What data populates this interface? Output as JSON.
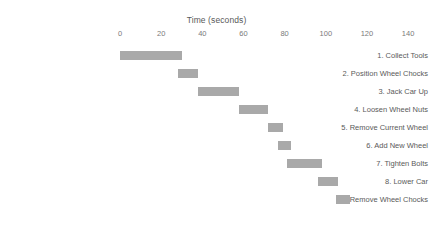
{
  "chart_data": {
    "type": "bar",
    "orientation": "horizontal",
    "subtype": "gantt",
    "title": "",
    "xlabel": "Time (seconds)",
    "ylabel": "",
    "xlim": [
      0,
      150
    ],
    "xticks": [
      0,
      20,
      40,
      60,
      80,
      100,
      120,
      140
    ],
    "xticklabels": [
      "0",
      "20",
      "40",
      "60",
      "80",
      "100",
      "120",
      "140"
    ],
    "grid": false,
    "legend": false,
    "bar_color": "#a9a9a9",
    "background_color": "#ffffff",
    "categories": [
      "1. Collect Tools",
      "2. Position Wheel Chocks",
      "3. Jack Car Up",
      "4. Loosen Wheel Nuts",
      "5. Remove Current Wheel",
      "6. Add New Wheel",
      "7. Tighten Bolts",
      "8. Lower Car",
      "9. Remove Wheel Chocks"
    ],
    "tasks": [
      {
        "label": "1. Collect Tools",
        "start": 0,
        "end": 30,
        "duration": 30
      },
      {
        "label": "2. Position Wheel Chocks",
        "start": 28,
        "end": 38,
        "duration": 10
      },
      {
        "label": "3. Jack Car Up",
        "start": 38,
        "end": 58,
        "duration": 20
      },
      {
        "label": "4. Loosen Wheel Nuts",
        "start": 58,
        "end": 72,
        "duration": 14
      },
      {
        "label": "5. Remove Current Wheel",
        "start": 72,
        "end": 79,
        "duration": 7
      },
      {
        "label": "6. Add New Wheel",
        "start": 77,
        "end": 83,
        "duration": 6
      },
      {
        "label": "7. Tighten Bolts",
        "start": 81,
        "end": 98,
        "duration": 17
      },
      {
        "label": "8. Lower Car",
        "start": 96,
        "end": 106,
        "duration": 10
      },
      {
        "label": "9. Remove Wheel Chocks",
        "start": 105,
        "end": 112,
        "duration": 7
      }
    ]
  }
}
